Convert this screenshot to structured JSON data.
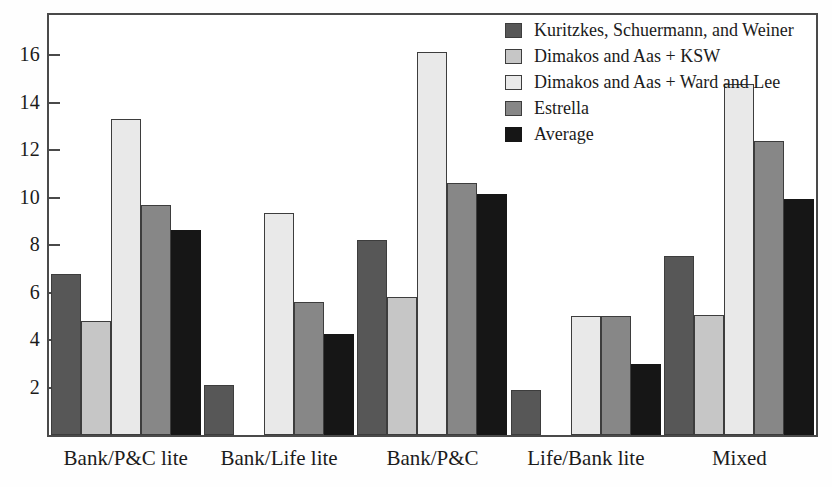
{
  "chart_data": {
    "type": "bar",
    "title": "",
    "subtitle": "",
    "xlabel": "",
    "ylabel": "",
    "ylim": [
      0,
      17.7
    ],
    "grid": false,
    "legend_position": "top-right",
    "y_ticks": [
      2,
      4,
      6,
      8,
      10,
      12,
      14,
      16
    ],
    "categories": [
      "Bank/P&C lite",
      "Bank/Life lite",
      "Bank/P&C",
      "Life/Bank lite",
      "Mixed"
    ],
    "series": [
      {
        "name": "Kuritzkes, Schuermann, and Weiner",
        "color": "#575757",
        "values": [
          6.8,
          2.1,
          8.2,
          1.9,
          7.55
        ]
      },
      {
        "name": "Dimakos and Aas + KSW",
        "color": "#c6c6c6",
        "values": [
          4.8,
          0,
          5.8,
          0,
          5.05
        ]
      },
      {
        "name": "Dimakos and Aas + Ward and Lee",
        "color": "#e9e9e9",
        "values": [
          13.3,
          9.35,
          16.15,
          5.0,
          14.8
        ]
      },
      {
        "name": "Estrella",
        "color": "#878787",
        "values": [
          9.7,
          5.6,
          10.6,
          5.0,
          12.4
        ]
      },
      {
        "name": "Average",
        "color": "#161616",
        "values": [
          8.65,
          4.25,
          10.15,
          3.0,
          9.95
        ]
      }
    ]
  },
  "axis": {
    "y_tick_labels": [
      "16",
      "14",
      "12",
      "10",
      "8",
      "6",
      "4",
      "2"
    ],
    "x_tick_labels": [
      "Bank/P&C lite",
      "Bank/Life lite",
      "Bank/P&C",
      "Life/Bank lite",
      "Mixed"
    ]
  },
  "legend": {
    "entries": [
      {
        "label": "Kuritzkes, Schuermann, and Weiner",
        "color": "#575757"
      },
      {
        "label": "Dimakos and Aas + KSW",
        "color": "#c6c6c6"
      },
      {
        "label": "Dimakos and Aas + Ward and Lee",
        "color": "#e9e9e9"
      },
      {
        "label": "Estrella",
        "color": "#878787"
      },
      {
        "label": "Average",
        "color": "#161616"
      }
    ]
  },
  "style": {
    "frame_color": "#4a4a4a",
    "background": "#ffffff",
    "text_color": "#1b1b1b"
  }
}
